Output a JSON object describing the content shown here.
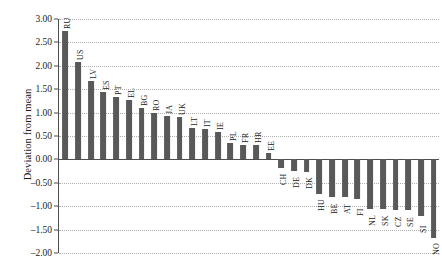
{
  "chart_data": {
    "type": "bar",
    "title": "",
    "subtitle": "",
    "xlabel": "",
    "ylabel": "Deviation from mean",
    "ylim": [
      -2.0,
      3.0
    ],
    "ytick_step": 0.5,
    "ytick_labels": [
      "3.00",
      "2.50",
      "2.00",
      "1.50",
      "1.00",
      "0.50",
      "0.00",
      "-0.50",
      "-1.00",
      "-1.50",
      "-2.00"
    ],
    "ytick_values": [
      3.0,
      2.5,
      2.0,
      1.5,
      1.0,
      0.5,
      0.0,
      -0.5,
      -1.0,
      -1.5,
      -2.0
    ],
    "grid": true,
    "grid_style": "dotted",
    "legend": false,
    "bar_color": "#595959",
    "categories": [
      "RU",
      "US",
      "LV",
      "ES",
      "PT",
      "EL",
      "BG",
      "RO",
      "JA",
      "UK",
      "LT",
      "IT",
      "IE",
      "PL",
      "FR",
      "HR",
      "EE",
      "CH",
      "DE",
      "DK",
      "HU",
      "BE",
      "AT",
      "FI",
      "NL",
      "SK",
      "CZ",
      "SE",
      "SI",
      "NO"
    ],
    "values": [
      2.75,
      2.09,
      1.68,
      1.45,
      1.33,
      1.27,
      1.09,
      1.0,
      0.92,
      0.91,
      0.68,
      0.66,
      0.58,
      0.36,
      0.31,
      0.3,
      0.13,
      -0.18,
      -0.25,
      -0.27,
      -0.74,
      -0.8,
      -0.8,
      -0.85,
      -1.05,
      -1.05,
      -1.08,
      -1.08,
      -1.22,
      -1.67
    ]
  }
}
